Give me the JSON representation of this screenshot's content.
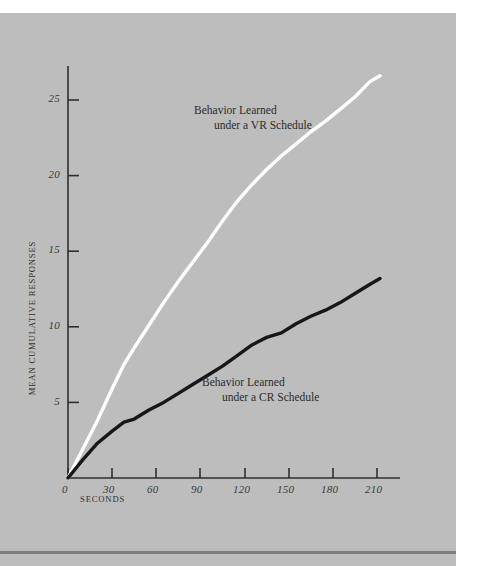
{
  "figure": {
    "background_color": "#bdbdbd",
    "page_color": "#ffffff",
    "rule_color": "#7d7d7d"
  },
  "axes": {
    "y_title": "MEAN CUMULATIVE RESPONSES",
    "x_title": "SECONDS",
    "x_ticks": [
      "0",
      "30",
      "60",
      "90",
      "120",
      "150",
      "180",
      "210"
    ],
    "y_ticks": [
      "5",
      "10",
      "15",
      "20",
      "25"
    ]
  },
  "annotations": {
    "vr": {
      "line1": "Behavior Learned",
      "line2": "under a VR Schedule"
    },
    "cr": {
      "line1": "Behavior Learned",
      "line2": "under a CR Schedule"
    }
  },
  "chart_data": {
    "type": "line",
    "title": "",
    "xlabel": "SECONDS",
    "ylabel": "MEAN CUMULATIVE RESPONSES",
    "xlim": [
      0,
      225
    ],
    "ylim": [
      0,
      28
    ],
    "xticks": [
      0,
      30,
      60,
      90,
      120,
      150,
      180,
      210
    ],
    "yticks": [
      5,
      10,
      15,
      20,
      25
    ],
    "grid": false,
    "legend": "inline-annotations",
    "series": [
      {
        "name": "Behavior Learned under a VR Schedule",
        "color": "#ffffff",
        "linewidth": 3.4,
        "x": [
          0,
          10,
          20,
          30,
          38,
          45,
          55,
          65,
          75,
          85,
          95,
          105,
          115,
          125,
          135,
          145,
          155,
          165,
          175,
          185,
          195,
          205,
          212
        ],
        "y": [
          0.0,
          1.9,
          3.8,
          5.9,
          7.5,
          8.6,
          10.1,
          11.6,
          13.0,
          14.3,
          15.6,
          17.0,
          18.3,
          19.4,
          20.4,
          21.3,
          22.1,
          22.9,
          23.6,
          24.4,
          25.2,
          26.2,
          26.6
        ]
      },
      {
        "name": "Behavior Learned under a CR Schedule",
        "color": "#171717",
        "linewidth": 3.4,
        "x": [
          0,
          10,
          20,
          30,
          38,
          45,
          55,
          65,
          75,
          85,
          95,
          105,
          115,
          125,
          135,
          145,
          155,
          165,
          175,
          185,
          195,
          205,
          212
        ],
        "y": [
          0.0,
          1.2,
          2.3,
          3.1,
          3.7,
          3.9,
          4.5,
          5.0,
          5.6,
          6.2,
          6.8,
          7.4,
          8.1,
          8.8,
          9.3,
          9.6,
          10.2,
          10.7,
          11.1,
          11.6,
          12.2,
          12.8,
          13.2
        ]
      }
    ]
  }
}
